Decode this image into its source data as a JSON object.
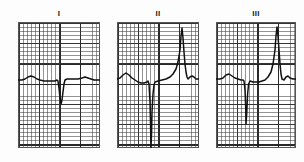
{
  "figure": {
    "kind": "ecg-rhythm-strip",
    "background_color": "#fdfdfd",
    "grid_minor_color": "#3c3c3c",
    "grid_major_color": "#1e1e1e",
    "trace_color": "#111111",
    "border_color": "#565656",
    "panel_width": 82,
    "panel_height": 126,
    "label_height": 13
  },
  "chart_data": {
    "type": "line",
    "title": "",
    "xlabel": "",
    "ylabel": "",
    "grid": true,
    "legend_position": "top",
    "panels": [
      {
        "label": "I",
        "x": 18,
        "y": 9,
        "baseline_y": 58,
        "xlim": [
          0,
          82
        ],
        "ylim": [
          0,
          126
        ],
        "morphology": "small upright P wave, deep narrow QS complex, flat T",
        "points": [
          [
            0,
            58
          ],
          [
            4,
            58
          ],
          [
            7,
            57
          ],
          [
            10,
            55
          ],
          [
            13,
            54
          ],
          [
            16,
            55
          ],
          [
            19,
            57
          ],
          [
            22,
            58
          ],
          [
            26,
            59
          ],
          [
            30,
            59
          ],
          [
            34,
            59
          ],
          [
            37,
            59
          ],
          [
            39,
            58
          ],
          [
            40,
            59
          ],
          [
            41,
            66
          ],
          [
            42,
            76
          ],
          [
            43,
            82
          ],
          [
            44,
            78
          ],
          [
            45,
            70
          ],
          [
            46,
            62
          ],
          [
            47,
            58
          ],
          [
            49,
            57
          ],
          [
            52,
            57
          ],
          [
            56,
            57
          ],
          [
            60,
            57
          ],
          [
            64,
            56
          ],
          [
            67,
            55
          ],
          [
            70,
            56
          ],
          [
            73,
            57
          ],
          [
            76,
            58
          ],
          [
            79,
            58
          ],
          [
            82,
            58
          ]
        ]
      },
      {
        "label": "II",
        "x": 117,
        "y": 9,
        "baseline_y": 58,
        "xlim": [
          0,
          82
        ],
        "ylim": [
          0,
          126
        ],
        "morphology": "P wave, very deep S wave below baseline, tall narrow R wave",
        "points": [
          [
            0,
            57
          ],
          [
            3,
            56
          ],
          [
            6,
            53
          ],
          [
            9,
            51
          ],
          [
            12,
            53
          ],
          [
            15,
            56
          ],
          [
            18,
            58
          ],
          [
            21,
            60
          ],
          [
            24,
            61
          ],
          [
            27,
            61
          ],
          [
            30,
            60
          ],
          [
            31,
            59
          ],
          [
            32,
            62
          ],
          [
            33,
            80
          ],
          [
            33.6,
            105
          ],
          [
            34,
            126
          ],
          [
            34.6,
            110
          ],
          [
            35,
            90
          ],
          [
            36,
            72
          ],
          [
            37,
            63
          ],
          [
            38,
            60
          ],
          [
            41,
            59
          ],
          [
            45,
            58
          ],
          [
            49,
            57
          ],
          [
            53,
            55
          ],
          [
            56,
            52
          ],
          [
            59,
            47
          ],
          [
            61,
            40
          ],
          [
            63,
            28
          ],
          [
            64,
            14
          ],
          [
            65,
            6
          ],
          [
            66,
            16
          ],
          [
            67,
            30
          ],
          [
            68,
            42
          ],
          [
            69,
            50
          ],
          [
            70,
            55
          ],
          [
            71,
            57
          ],
          [
            73,
            55
          ],
          [
            75,
            54
          ],
          [
            77,
            55
          ],
          [
            79,
            57
          ],
          [
            82,
            57
          ]
        ]
      },
      {
        "label": "III",
        "x": 216,
        "y": 9,
        "baseline_y": 58,
        "xlim": [
          0,
          80
        ],
        "ylim": [
          0,
          126
        ],
        "morphology": "rounded P wave, deep narrow S wave, tall narrow R wave",
        "points": [
          [
            0,
            57
          ],
          [
            4,
            57
          ],
          [
            7,
            56
          ],
          [
            10,
            53
          ],
          [
            13,
            52
          ],
          [
            16,
            54
          ],
          [
            19,
            56
          ],
          [
            22,
            57
          ],
          [
            25,
            58
          ],
          [
            27,
            58
          ],
          [
            28,
            59
          ],
          [
            29,
            68
          ],
          [
            29.8,
            88
          ],
          [
            30,
            102
          ],
          [
            30.8,
            90
          ],
          [
            31.6,
            72
          ],
          [
            32.6,
            62
          ],
          [
            34,
            59
          ],
          [
            37,
            60
          ],
          [
            40,
            60
          ],
          [
            43,
            60
          ],
          [
            46,
            59
          ],
          [
            49,
            58
          ],
          [
            52,
            55
          ],
          [
            55,
            50
          ],
          [
            57,
            42
          ],
          [
            59,
            28
          ],
          [
            60,
            14
          ],
          [
            61,
            5
          ],
          [
            62,
            14
          ],
          [
            63,
            28
          ],
          [
            64,
            42
          ],
          [
            65,
            52
          ],
          [
            66,
            57
          ],
          [
            68,
            58
          ],
          [
            70,
            55
          ],
          [
            72,
            54
          ],
          [
            74,
            56
          ],
          [
            77,
            57
          ],
          [
            80,
            57
          ]
        ]
      }
    ]
  }
}
